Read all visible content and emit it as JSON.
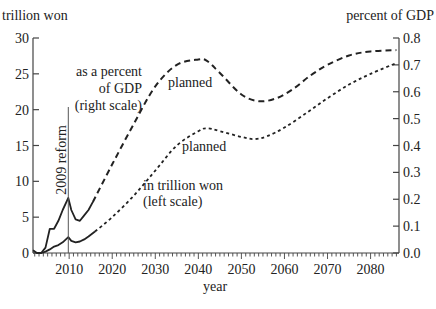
{
  "chart_data": {
    "type": "line",
    "title": "",
    "xlabel": "year",
    "ylabel_left": "trillion won",
    "ylabel_right": "percent of GDP",
    "x_range": [
      2001.6,
      2086.6
    ],
    "ylim_left": [
      0,
      30
    ],
    "ylim_right": [
      0.0,
      0.8
    ],
    "x_ticks": [
      "2010",
      "2020",
      "2030",
      "2040",
      "2050",
      "2060",
      "2070",
      "2080"
    ],
    "y_ticks_left": [
      "0",
      "5",
      "10",
      "15",
      "20",
      "25",
      "30"
    ],
    "y_ticks_right": [
      "0.0",
      "0.1",
      "0.2",
      "0.3",
      "0.4",
      "0.5",
      "0.6",
      "0.7",
      "0.8"
    ],
    "grid": false,
    "annotations": {
      "reform_label": "2009 reform",
      "reform_year": 2009.8,
      "pct_label_1": "as a percent",
      "pct_label_2": "of GDP",
      "pct_label_3": "(right scale)",
      "won_label_1": "in trillion won",
      "won_label_2": "(left scale)",
      "planned_1": "planned",
      "planned_2": "planned"
    },
    "series": [
      {
        "name": "as a percent of GDP (actual)",
        "axis": "right",
        "style": "solid",
        "x": [
          2001.6,
          2002.5,
          2003.5,
          2004.5,
          2005.5,
          2006.5,
          2007.5,
          2008.5,
          2009.8,
          2010.5,
          2011.5,
          2012.5,
          2013.5,
          2014.5,
          2015.5
        ],
        "values": [
          0.01,
          0.0,
          0.0,
          0.02,
          0.09,
          0.09,
          0.12,
          0.16,
          0.205,
          0.16,
          0.125,
          0.12,
          0.14,
          0.16,
          0.19
        ]
      },
      {
        "name": "as a percent of GDP (planned)",
        "axis": "right",
        "style": "dashed",
        "x": [
          2015.5,
          2020,
          2025,
          2030,
          2035,
          2040,
          2042,
          2045,
          2050,
          2054,
          2058,
          2062,
          2066,
          2070,
          2075,
          2080,
          2086
        ],
        "values": [
          0.19,
          0.33,
          0.48,
          0.62,
          0.7,
          0.72,
          0.715,
          0.67,
          0.59,
          0.565,
          0.575,
          0.61,
          0.66,
          0.7,
          0.735,
          0.75,
          0.755
        ]
      },
      {
        "name": "in trillion won (actual)",
        "axis": "left",
        "style": "solid",
        "x": [
          2002.5,
          2003.5,
          2004.5,
          2005.5,
          2006.5,
          2007.5,
          2008.5,
          2009.8,
          2010.5,
          2011.5,
          2012.5,
          2013.5,
          2014.5,
          2016
        ],
        "values": [
          0.0,
          0.0,
          0.2,
          0.5,
          0.9,
          1.1,
          1.5,
          2.2,
          1.7,
          1.5,
          1.6,
          1.9,
          2.3,
          3.0
        ]
      },
      {
        "name": "in trillion won (planned)",
        "axis": "left",
        "style": "dotted",
        "x": [
          2016,
          2020,
          2025,
          2030,
          2035,
          2040,
          2042,
          2045,
          2050,
          2053,
          2056,
          2060,
          2065,
          2070,
          2075,
          2080,
          2086
        ],
        "values": [
          3.0,
          5.0,
          8.0,
          11.5,
          15.0,
          17.0,
          17.4,
          17.0,
          16.2,
          15.9,
          16.3,
          17.5,
          19.5,
          21.6,
          23.5,
          25.0,
          26.5
        ]
      }
    ]
  }
}
